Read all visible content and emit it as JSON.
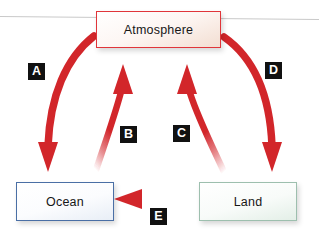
{
  "diagram": {
    "background_color": "#ffffff",
    "arrow_color": "#d2262c",
    "label_box_color": "#111111",
    "label_text_color": "#ffffff",
    "nodes": [
      {
        "id": "atmosphere",
        "label": "Atmosphere",
        "border_color": "#e0353a",
        "fill_color": "#f3ded2"
      },
      {
        "id": "ocean",
        "label": "Ocean",
        "border_color": "#4a6fa5",
        "fill_color": "#e8eef6"
      },
      {
        "id": "land",
        "label": "Land",
        "border_color": "#9dbfae",
        "fill_color": "#e3efe7"
      }
    ],
    "arrows": [
      {
        "id": "a",
        "label": "A",
        "from": "atmosphere",
        "to": "ocean",
        "direction": "down-left"
      },
      {
        "id": "b",
        "label": "B",
        "from": "ocean",
        "to": "atmosphere",
        "direction": "up-right"
      },
      {
        "id": "c",
        "label": "C",
        "from": "land",
        "to": "atmosphere",
        "direction": "up-left"
      },
      {
        "id": "d",
        "label": "D",
        "from": "atmosphere",
        "to": "land",
        "direction": "down-right"
      },
      {
        "id": "e",
        "label": "E",
        "from": "land",
        "to": "ocean",
        "direction": "left"
      }
    ]
  }
}
